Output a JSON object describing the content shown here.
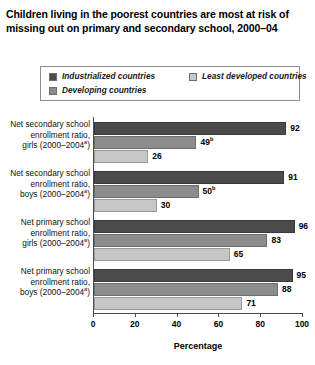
{
  "title": {
    "line1": "Children living in the poorest countries are most at risk of",
    "line2": "missing out on primary and secondary school, 2000–04"
  },
  "legend": {
    "items": [
      {
        "label": "Industrialized countries",
        "color": "#4b4b4b",
        "key": "industrialized"
      },
      {
        "label": "Least developed countries",
        "color": "#c6c6c6",
        "key": "least"
      },
      {
        "label": "Developing countries",
        "color": "#8c8c8c",
        "key": "developing"
      }
    ]
  },
  "axis": {
    "title": "Percentage",
    "ticks": [
      "0",
      "20",
      "40",
      "60",
      "80",
      "100"
    ]
  },
  "categories": [
    {
      "line1": "Net secondary school",
      "line2": "enrollment ratio,",
      "line3": "girls (2000–2004",
      "note": "a"
    },
    {
      "line1": "Net secondary school",
      "line2": "enrollment ratio,",
      "line3": "boys (2000–2004",
      "note": "a"
    },
    {
      "line1": "Net primary school",
      "line2": "enrollment ratio,",
      "line3": "girls (2000–2004",
      "note": "a"
    },
    {
      "line1": "Net primary school",
      "line2": "enrollment ratio,",
      "line3": "boys (2000–2004",
      "note": "a"
    }
  ],
  "bars": {
    "g0": [
      {
        "value": 92,
        "label": "92",
        "note": "",
        "series": "industrialized"
      },
      {
        "value": 49,
        "label": "49",
        "note": "b",
        "series": "developing"
      },
      {
        "value": 26,
        "label": "26",
        "note": "",
        "series": "least"
      }
    ],
    "g1": [
      {
        "value": 91,
        "label": "91",
        "note": "",
        "series": "industrialized"
      },
      {
        "value": 50,
        "label": "50",
        "note": "b",
        "series": "developing"
      },
      {
        "value": 30,
        "label": "30",
        "note": "",
        "series": "least"
      }
    ],
    "g2": [
      {
        "value": 96,
        "label": "96",
        "note": "",
        "series": "industrialized"
      },
      {
        "value": 83,
        "label": "83",
        "note": "",
        "series": "developing"
      },
      {
        "value": 65,
        "label": "65",
        "note": "",
        "series": "least"
      }
    ],
    "g3": [
      {
        "value": 95,
        "label": "95",
        "note": "",
        "series": "industrialized"
      },
      {
        "value": 88,
        "label": "88",
        "note": "",
        "series": "developing"
      },
      {
        "value": 71,
        "label": "71",
        "note": "",
        "series": "least"
      }
    ]
  },
  "chart_data": {
    "type": "bar",
    "orientation": "horizontal",
    "title": "Children living in the poorest countries are most at risk of missing out on primary and secondary school, 2000–04",
    "xlabel": "Percentage",
    "ylabel": "",
    "xlim": [
      0,
      100
    ],
    "xticks": [
      0,
      20,
      40,
      60,
      80,
      100
    ],
    "grid": false,
    "legend_position": "top",
    "categories": [
      "Net secondary school enrollment ratio, girls (2000–2004a)",
      "Net secondary school enrollment ratio, boys (2000–2004a)",
      "Net primary school enrollment ratio, girls (2000–2004a)",
      "Net primary school enrollment ratio, boys (2000–2004a)"
    ],
    "series": [
      {
        "name": "Industrialized countries",
        "color": "#4b4b4b",
        "values": [
          92,
          91,
          96,
          95
        ]
      },
      {
        "name": "Developing countries",
        "color": "#8c8c8c",
        "values": [
          49,
          50,
          83,
          88
        ]
      },
      {
        "name": "Least developed countries",
        "color": "#c6c6c6",
        "values": [
          26,
          30,
          65,
          71
        ]
      }
    ],
    "annotations": [
      "49b",
      "50b"
    ]
  }
}
